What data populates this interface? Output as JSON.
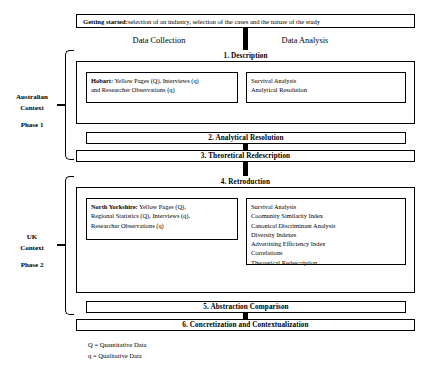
{
  "header": {
    "getting_started_label": "Getting started:",
    "getting_started_text": " selection of an industry, selection of the cases and the nature of the study"
  },
  "columns": {
    "left": "Data Collection",
    "right": "Data Analysis"
  },
  "phases": [
    {
      "side_label_context": "Australian",
      "side_label_context2": "Context",
      "side_label_phase": "Phase 1",
      "stage_head": "1. Description",
      "collection": {
        "lead": "Hobart:",
        "line1_rest": " Yellow Pages (Q), Interviews (q)",
        "line2": "and Researcher Observations (q)"
      },
      "analysis_items": [
        "Survival Analysis",
        "Analytical Resolution"
      ],
      "stage_bars": [
        "2. Analytical Resolution",
        "3. Theoretical Redescription"
      ]
    },
    {
      "side_label_context": "UK",
      "side_label_context2": "Context",
      "side_label_phase": "Phase 2",
      "stage_head": "4. Retroduction",
      "collection": {
        "lead": "North Yorkshire:",
        "line1_rest": " Yellow Pages (Q),",
        "line2": "Regional Statistics (Q), Interviews (q),",
        "line3": "Researcher Observations (q)"
      },
      "analysis_items": [
        "Survival Analysis",
        "Coomunity Similarity Index",
        "Canonical Discriminant Analysis",
        "Diversity Indexes",
        "Advertising Efficiency Index",
        "Correlations",
        "Theoretical Redescription"
      ],
      "stage_bars": [
        "5. Abstraction Comparison",
        "6. Concretization and Contextualization"
      ]
    }
  ],
  "legend": {
    "line1": "Q = Quantitative Data",
    "line2": "q = Qualitative Data"
  }
}
